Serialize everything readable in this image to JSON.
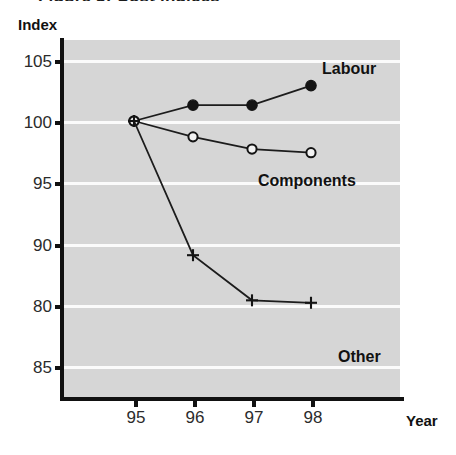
{
  "figure": {
    "title_fragment": "Figure 3: Cost indices",
    "y_axis_title": "Index",
    "x_axis_title": "Year"
  },
  "chart_data": {
    "type": "line",
    "title": "",
    "xlabel": "Year",
    "ylabel": "Index",
    "x": [
      "95",
      "96",
      "97",
      "98"
    ],
    "xtick_labels": [
      "95",
      "96",
      "97",
      "98"
    ],
    "ytick_labels": [
      "105",
      "100",
      "95",
      "90",
      "80",
      "85"
    ],
    "ytick_values": [
      105,
      100,
      95,
      90,
      80,
      85
    ],
    "ylim": [
      82.5,
      107.5
    ],
    "grid": "horizontal-white",
    "legend_position": "inline-right",
    "plot_background": "#d6d6d6",
    "series": [
      {
        "name": "Labour",
        "marker": "filled-circle",
        "values": [
          100.0,
          101.3,
          101.3,
          102.9
        ]
      },
      {
        "name": "Components",
        "marker": "open-circle",
        "values": [
          100.0,
          98.7,
          97.7,
          97.4
        ]
      },
      {
        "name": "Other",
        "marker": "plus",
        "values": [
          100.0,
          89.0,
          85.3,
          85.1
        ]
      }
    ]
  },
  "colors": {
    "plot_background": "#d6d6d6",
    "gridline": "#fbfbfb",
    "ink": "#141414",
    "page": "#ffffff"
  }
}
